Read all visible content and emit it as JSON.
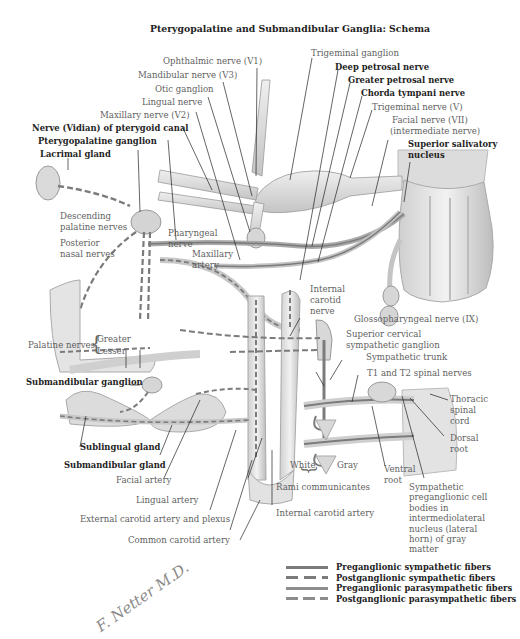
{
  "title": "Pterygopalatine and Submandibular Ganglia: Schema",
  "labels": {
    "ophthalmic_nerve": "Ophthalmic nerve (V1)",
    "mandibular_nerve": "Mandibular nerve (V3)",
    "otic_ganglion": "Otic ganglion",
    "lingual_nerve": "Lingual nerve",
    "maxillary_nerve": "Maxillary nerve (V2)",
    "vidian_nerve": "Nerve (Vidian) of pterygoid canal",
    "pterygopalatine_ganglion": "Pterygopalatine ganglion",
    "lacrimal_gland": "Lacrimal gland",
    "trigeminal_ganglion": "Trigeminal ganglion",
    "deep_petrosal_nerve": "Deep petrosal nerve",
    "greater_petrosal_nerve": "Greater petrosal nerve",
    "chorda_tympani_nerve": "Chorda tympani nerve",
    "trigeminal_nerve": "Trigeminal nerve (V)",
    "facial_nerve_1": "Facial nerve (VII)",
    "facial_nerve_2": "(intermediate nerve)",
    "superior_salivatory_1": "Superior salivatory",
    "superior_salivatory_2": "nucleus",
    "descending_palatine_1": "Descending",
    "descending_palatine_2": "palatine nerves",
    "posterior_nasal_1": "Posterior",
    "posterior_nasal_2": "nasal nerves",
    "pharyngeal_nerve_1": "Pharyngeal",
    "pharyngeal_nerve_2": "nerve",
    "maxillary_artery_1": "Maxillary",
    "maxillary_artery_2": "artery",
    "internal_carotid_nerve_1": "Internal",
    "internal_carotid_nerve_2": "carotid",
    "internal_carotid_nerve_3": "nerve",
    "glossopharyngeal_nerve": "Glossopharyngeal nerve (IX)",
    "superior_cervical_1": "Superior cervical",
    "superior_cervical_2": "sympathetic ganglion",
    "sympathetic_trunk": "Sympathetic trunk",
    "t1_t2_spinal_nerves": "T1 and T2 spinal nerves",
    "thoracic_spinal_cord_1": "Thoracic",
    "thoracic_spinal_cord_2": "spinal",
    "thoracic_spinal_cord_3": "cord",
    "dorsal_root_1": "Dorsal",
    "dorsal_root_2": "root",
    "palatine_nerves": "Palatine nerves",
    "greater": "Greater",
    "lesser": "Lesser",
    "submandibular_ganglion": "Submandibular ganglion",
    "sublingual_gland": "Sublingual gland",
    "submandibular_gland": "Submandibular gland",
    "facial_artery": "Facial artery",
    "lingual_artery": "Lingual artery",
    "external_carotid": "External carotid artery and plexus",
    "common_carotid": "Common carotid artery",
    "white": "White",
    "gray": "Gray",
    "rami_communicantes": "Rami communicantes",
    "ventral_root_1": "Ventral",
    "ventral_root_2": "root",
    "internal_carotid_artery": "Internal carotid artery",
    "sympathetic_cell_bodies": [
      "Sympathetic",
      "preganglionic cell",
      "bodies in",
      "intermediolateral",
      "nucleus (lateral",
      "horn) of gray",
      "matter"
    ]
  },
  "legend": [
    {
      "style": "solid",
      "label": "Preganglionic sympathetic fibers"
    },
    {
      "style": "dashed",
      "label": "Postganglionic sympathetic fibers"
    },
    {
      "style": "solid",
      "label": "Preganglionic parasympathetic fibers"
    },
    {
      "style": "dashed",
      "label": "Postganglionic parasympathetic fibers"
    }
  ],
  "signature": "F. Netter M.D.",
  "colors": {
    "nerve_fill": "#d9d9d9",
    "nerve_edge": "#9a9a9a",
    "fiber": "#7b7b7b",
    "leader": "#222222",
    "bold_text": "#1e1e1e",
    "light_text": "#5f5f5f"
  }
}
